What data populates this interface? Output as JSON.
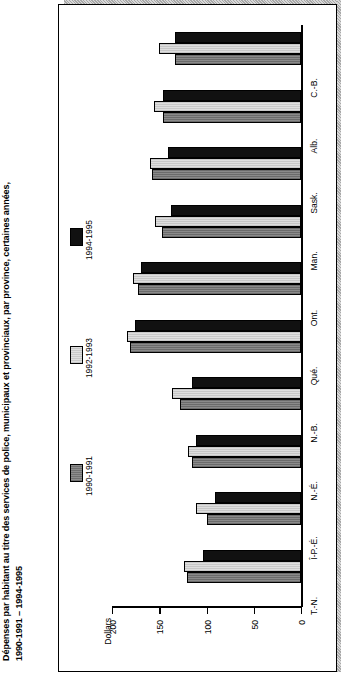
{
  "title": {
    "line1": "Dépenses par habitant au titre des services de police, municipaux et provinciaux, par province, certaines années,",
    "line2": "1990-1991 – 1994-1995"
  },
  "legend": {
    "items": [
      {
        "label": "1990-1991",
        "color": "#7d7d7d",
        "key": "y1990"
      },
      {
        "label": "1992-1993",
        "color": "#d4d4d4",
        "key": "y1992"
      },
      {
        "label": "1994-1995",
        "color": "#111111",
        "key": "y1994"
      }
    ]
  },
  "axis": {
    "title": "Dollars",
    "ticks": [
      "200",
      "150",
      "100",
      "50",
      "0"
    ]
  },
  "chart_data": {
    "type": "bar",
    "orientation": "horizontal",
    "title": "Dépenses par habitant au titre des services de police, municipaux et provinciaux, par province, certaines années, 1990-1991 – 1994-1995",
    "xlabel": "Dollars",
    "ylabel": "",
    "xlim": [
      0,
      200
    ],
    "xticks": [
      0,
      50,
      100,
      150,
      200
    ],
    "grid": false,
    "legend_position": "left",
    "categories": [
      "C.-B.",
      "Alb.",
      "Sask.",
      "Man.",
      "Ont.",
      "Qué.",
      "N.-B.",
      "N.-É.",
      "Î-P.-É.",
      "T.-N."
    ],
    "series": [
      {
        "name": "1990-1991",
        "color": "#7d7d7d",
        "values": [
          133,
          146,
          158,
          147,
          172,
          181,
          128,
          115,
          100,
          121
        ]
      },
      {
        "name": "1992-1993",
        "color": "#d4d4d4",
        "values": [
          150,
          156,
          160,
          154,
          178,
          184,
          136,
          120,
          111,
          124
        ]
      },
      {
        "name": "1994-1995",
        "color": "#111111",
        "values": [
          133,
          146,
          141,
          138,
          169,
          176,
          115,
          111,
          91,
          104
        ]
      }
    ]
  }
}
